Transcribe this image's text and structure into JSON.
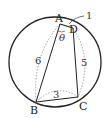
{
  "figure": {
    "points": {
      "A": {
        "label": "A",
        "x": 60,
        "y": 24
      },
      "B": {
        "label": "B",
        "x": 36,
        "y": 102
      },
      "C": {
        "label": "C",
        "x": 78,
        "y": 97
      },
      "D": {
        "label": "D",
        "x": 73,
        "y": 28
      }
    },
    "segment_labels": {
      "AD": "1",
      "AB": "6",
      "DC": "5",
      "BC": "3"
    },
    "angle_label": "θ",
    "circle": {
      "cx": 55,
      "cy": 62,
      "rx": 46,
      "ry": 45
    },
    "colors": {
      "stroke": "#222222",
      "dotted": "#9a9a9a"
    }
  }
}
